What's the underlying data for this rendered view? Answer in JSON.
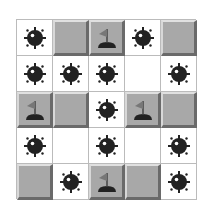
{
  "board": {
    "rows": 5,
    "cols": 5,
    "cells": [
      [
        "mine",
        "covered",
        "flag",
        "mine",
        "covered"
      ],
      [
        "mine",
        "mine",
        "mine",
        "empty",
        "mine"
      ],
      [
        "flag",
        "covered",
        "mine",
        "flag",
        "covered"
      ],
      [
        "mine",
        "empty",
        "mine",
        "empty",
        "mine"
      ],
      [
        "covered",
        "mine",
        "flag",
        "covered",
        "mine"
      ]
    ]
  },
  "colors": {
    "covered": "#a8a8a8",
    "mine": "#222222",
    "background": "#ffffff"
  }
}
